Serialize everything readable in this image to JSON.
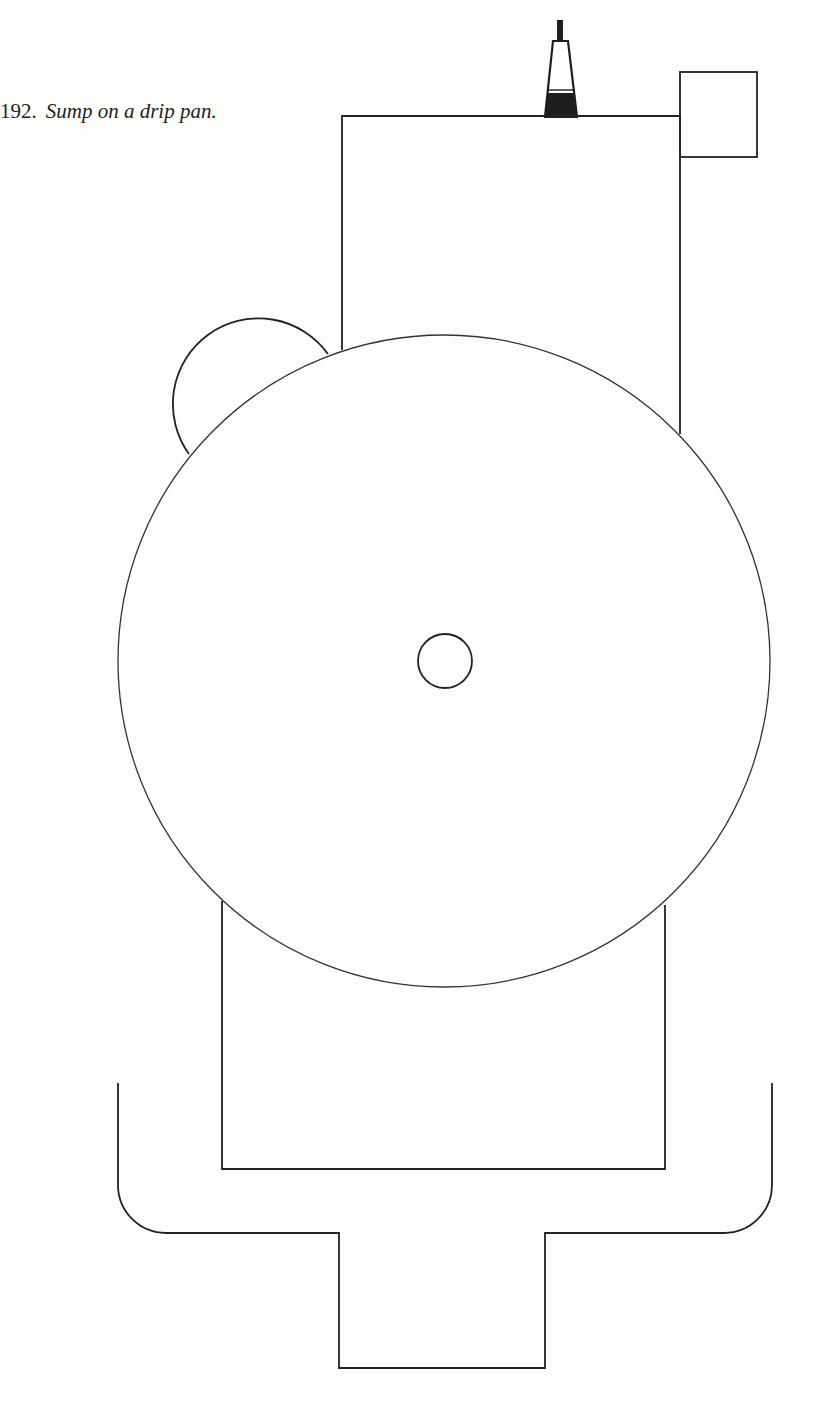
{
  "figure": {
    "number": "192.",
    "caption": "Sump on a drip pan."
  },
  "diagram": {
    "colors": {
      "line": "#222222",
      "background": "#fdfdfb",
      "fill_dark": "#1e1e1e"
    },
    "components": [
      {
        "id": "nozzle",
        "type": "tapered-cap",
        "stem": [
          557,
          20,
          6,
          21
        ],
        "top": [
          553,
          41,
          568,
          41
        ],
        "bottom": [
          545,
          117,
          577,
          117
        ],
        "dark_fill_from_y": 93
      },
      {
        "id": "side-box",
        "type": "rect",
        "x": 680,
        "y": 72,
        "w": 77,
        "h": 85
      },
      {
        "id": "upper-housing",
        "type": "rect",
        "x": 342,
        "y": 116,
        "w": 338,
        "h_to_circle": true
      },
      {
        "id": "small-side-circle",
        "type": "circle",
        "cx": 257,
        "cy": 404,
        "r": 84
      },
      {
        "id": "large-disc",
        "type": "circle",
        "cx": 444,
        "cy": 661,
        "r": 326
      },
      {
        "id": "hub",
        "type": "circle",
        "cx": 445,
        "cy": 661,
        "r": 27
      },
      {
        "id": "lower-housing",
        "type": "rect",
        "x": 222,
        "bottom": 1169,
        "right": 665
      },
      {
        "id": "drip-pan",
        "type": "path",
        "left": 118,
        "right": 772,
        "top": 1083,
        "bottom": 1233,
        "corner_radius": 48
      },
      {
        "id": "sump",
        "type": "rect",
        "x": 339,
        "y": 1233,
        "right": 545,
        "bottom": 1368
      }
    ]
  }
}
